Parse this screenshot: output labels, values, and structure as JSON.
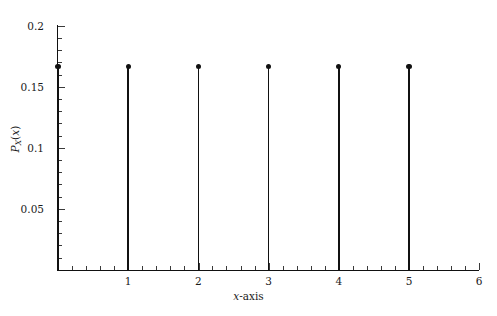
{
  "chart_data": {
    "type": "scatter",
    "plot_style": "stem",
    "title": "",
    "xlabel": "x-axis",
    "ylabel": "P_X(x)",
    "x": [
      0,
      1,
      2,
      3,
      4,
      5
    ],
    "values": [
      0.1667,
      0.1667,
      0.1667,
      0.1667,
      0.1667,
      0.1667
    ],
    "series": [
      {
        "name": "P_X(x)",
        "x": [
          0,
          1,
          2,
          3,
          4,
          5
        ],
        "values": [
          0.1667,
          0.1667,
          0.1667,
          0.1667,
          0.1667,
          0.1667
        ]
      }
    ],
    "xlim": [
      0,
      6
    ],
    "ylim": [
      0,
      0.2
    ],
    "x_ticks": [
      1,
      2,
      3,
      4,
      5,
      6
    ],
    "x_tick_labels": [
      "1",
      "2",
      "3",
      "4",
      "5",
      "6"
    ],
    "x_minor_tick_step": 0.2,
    "y_ticks": [
      0.05,
      0.1,
      0.15,
      0.2
    ],
    "y_tick_labels": [
      "0.05",
      "0.1",
      "0.15",
      "0.2"
    ],
    "y_minor_tick_step": 0.01,
    "grid": false,
    "legend": null,
    "marker": "filled-circle",
    "colors": {
      "line": "#111111",
      "marker": "#111111",
      "axis": "#111111",
      "text": "#1a1a1a",
      "background": "#ffffff"
    },
    "annotations": []
  },
  "axes": {
    "x_title_plain": "x-axis",
    "x_title_italic_part": "x",
    "x_title_rest": "-axis",
    "y_title_base": "P",
    "y_title_sub": "X",
    "y_title_arg_open": "(",
    "y_title_arg": "x",
    "y_title_arg_close": ")"
  },
  "y_tick_labels": {
    "t020": "0.2",
    "t015": "0.15",
    "t010": "0.1",
    "t005": "0.05"
  },
  "x_tick_labels": {
    "t1": "1",
    "t2": "2",
    "t3": "3",
    "t4": "4",
    "t5": "5",
    "t6": "6"
  }
}
